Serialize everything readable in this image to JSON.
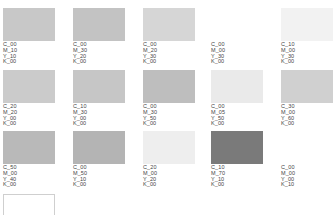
{
  "swatches": [
    {
      "c": "C_00",
      "m": "M_10",
      "y": "Y_10",
      "k": "K_00",
      "color": "#c8c8c8"
    },
    {
      "c": "C_00",
      "m": "M_30",
      "y": "Y_20",
      "k": "K_00",
      "color": "#c3c3c3"
    },
    {
      "c": "C_00",
      "m": "M_20",
      "y": "Y_30",
      "k": "K_00",
      "color": "#d6d6d6"
    },
    {
      "c": "C_00",
      "m": "M_00",
      "y": "Y_30",
      "k": "K_00",
      "color": "#ffffff"
    },
    {
      "c": "C_10",
      "m": "M_00",
      "y": "Y_30",
      "k": "K_00",
      "color": "#f2f2f2"
    },
    {
      "c": "C_20",
      "m": "M_20",
      "y": "Y_00",
      "k": "K_00",
      "color": "#cbcbcb"
    },
    {
      "c": "C_10",
      "m": "M_30",
      "y": "Y_00",
      "k": "K_00",
      "color": "#c6c6c6"
    },
    {
      "c": "C_00",
      "m": "M_30",
      "y": "Y_50",
      "k": "K_00",
      "color": "#bebebe"
    },
    {
      "c": "C_00",
      "m": "M_05",
      "y": "Y_50",
      "k": "K_00",
      "color": "#eaeaea"
    },
    {
      "c": "C_30",
      "m": "M_00",
      "y": "Y_60",
      "k": "K_00",
      "color": "#d0d0d0"
    },
    {
      "c": "C_50",
      "m": "M_00",
      "y": "Y_40",
      "k": "K_00",
      "color": "#b9b9b9"
    },
    {
      "c": "C_00",
      "m": "M_50",
      "y": "Y_10",
      "k": "K_00",
      "color": "#b4b4b4"
    },
    {
      "c": "C_20",
      "m": "M_00",
      "y": "Y_20",
      "k": "K_00",
      "color": "#eeeeee"
    },
    {
      "c": "C_10",
      "m": "M_70",
      "y": "Y_10",
      "k": "K_00",
      "color": "#7a7a7a"
    },
    {
      "c": "C_00",
      "m": "M_00",
      "y": "Y_00",
      "k": "K_10",
      "color": "#ffffff"
    }
  ]
}
